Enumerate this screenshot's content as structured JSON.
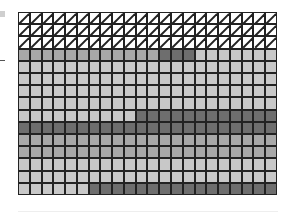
{
  "diagram": {
    "type": "cell-grid",
    "columns": 22,
    "rows": 15,
    "legend": {
      "H": "hatched / diagonal-striped (white with slash)",
      "L": "light gray",
      "M": "medium gray",
      "D": "dark gray"
    },
    "colors": {
      "H": "#ffffff",
      "L": "#c8c8c8",
      "M": "#a8a8a8",
      "D": "#6e6e6e",
      "grid_line": "#222222"
    },
    "row_pattern": [
      "HHHHHHHHHHHHHHHHHHHHHH",
      "HHHHHHHHHHHHHHHHHHHHHH",
      "HHHHHHHHHHHHHHHHHHHHHH",
      "MMMMMMMMMMMMDDDLLLLLLL",
      "LLLLLLLLLLLLLLLLLLLLLL",
      "LLLLLLLLLLLLLLLLLLLLLL",
      "LLLLLLLLLLLLLLLLLLLLLL",
      "LLLLLLLLLLLLLLLLLLLLLL",
      "LLLLLLLLLLDDDDDDDDDDDD",
      "DDDDDDDDDDDDDDDDDDDDDD",
      "MMMMMMMMMMMMMMMMMMMMMM",
      "MMMMMMMMMMMMMMMMMMMMMM",
      "LLLLLLLLLLLLLLLLLLLLLL",
      "LLLLLLLLLLLLLLLLLLLLLL",
      "LLLLLLDDDDDDDDDDDDDDDD"
    ]
  }
}
